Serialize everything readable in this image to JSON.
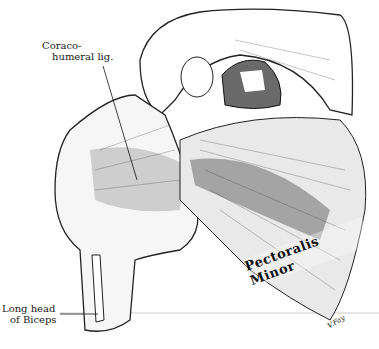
{
  "figure": {
    "labels": {
      "coracohumeral_line1": "Coraco-",
      "coracohumeral_line2": "humeral lig.",
      "biceps_line1": "Long head",
      "biceps_line2": "of Biceps",
      "pectoralis": "Pectoralis Minor",
      "signature": "V.Fay"
    },
    "colors": {
      "ink": "#1a1a1a",
      "paper": "#ffffff",
      "shade": "#9a9a9a",
      "baseline": "#c8c8c8"
    }
  }
}
